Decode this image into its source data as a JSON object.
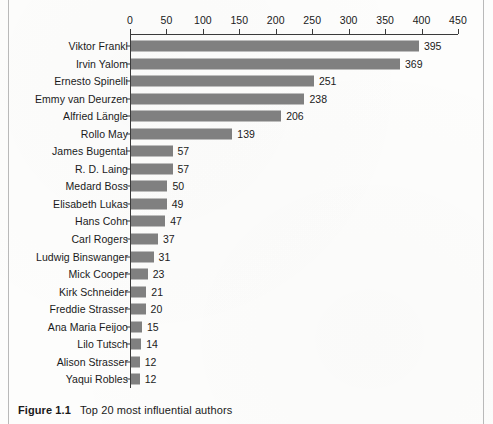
{
  "figure": {
    "number_label": "Figure 1.1",
    "caption": "Top 20 most influential authors"
  },
  "chart_data": {
    "type": "bar",
    "orientation": "horizontal",
    "title": "Top 20 most influential authors",
    "xlabel": "",
    "ylabel": "",
    "xlim": [
      0,
      450
    ],
    "xticks": [
      0,
      50,
      100,
      150,
      200,
      250,
      300,
      350,
      400,
      450
    ],
    "tick_labels": [
      "0",
      "50",
      "100",
      "150",
      "200",
      "250",
      "300",
      "350",
      "400",
      "450"
    ],
    "grid": false,
    "legend": false,
    "axis_position": "top",
    "bar_color": "#808080",
    "text_color": "#1a1a1a",
    "categories": [
      "Viktor Frankl",
      "Irvin Yalom",
      "Ernesto Spinelli",
      "Emmy van Deurzen",
      "Alfried Längle",
      "Rollo May",
      "James Bugental",
      "R. D. Laing",
      "Medard Boss",
      "Elisabeth Lukas",
      "Hans Cohn",
      "Carl Rogers",
      "Ludwig Binswanger",
      "Mick Cooper",
      "Kirk Schneider",
      "Freddie Strasser",
      "Ana Maria Feijoo",
      "Lilo Tutsch",
      "Alison Strasser",
      "Yaqui Robles"
    ],
    "values": [
      395,
      369,
      251,
      238,
      206,
      139,
      57,
      57,
      50,
      49,
      47,
      37,
      31,
      23,
      21,
      20,
      15,
      14,
      12,
      12
    ],
    "value_labels": [
      "395",
      "369",
      "251",
      "238",
      "206",
      "139",
      "57",
      "57",
      "50",
      "49",
      "47",
      "37",
      "31",
      "23",
      "21",
      "20",
      "15",
      "14",
      "12",
      "12"
    ]
  }
}
